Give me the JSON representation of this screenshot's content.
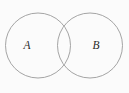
{
  "figure": {
    "name": "two-set-venn-diagram",
    "width": 129,
    "height": 93,
    "background_color": "#fbfbfb"
  },
  "style": {
    "stroke_color": "#9a9a9a",
    "label_color": "#2b2b2b",
    "stroke_width": 0.9,
    "label_font_size": 11.5
  },
  "sets": [
    {
      "id": "A",
      "label": "A",
      "cx": 38,
      "cy": 45.5,
      "r": 32.5,
      "label_x": 27,
      "label_y": 45.5
    },
    {
      "id": "B",
      "label": "B",
      "cx": 90,
      "cy": 45.5,
      "r": 32.5,
      "label_x": 96,
      "label_y": 45.5
    }
  ],
  "chart_data": {
    "type": "diagram",
    "subtype": "venn",
    "title": "",
    "set_count": 2,
    "categories": [
      "A",
      "B"
    ],
    "regions": [
      {
        "id": "A-only",
        "label": "",
        "sets": [
          "A"
        ]
      },
      {
        "id": "A-and-B",
        "label": "",
        "sets": [
          "A",
          "B"
        ]
      },
      {
        "id": "B-only",
        "label": "",
        "sets": [
          "B"
        ]
      }
    ],
    "intersection_points": [
      {
        "x": 64,
        "y": 18
      },
      {
        "x": 64,
        "y": 73
      }
    ],
    "shaded_regions": [],
    "legend": "none",
    "grid": false
  }
}
